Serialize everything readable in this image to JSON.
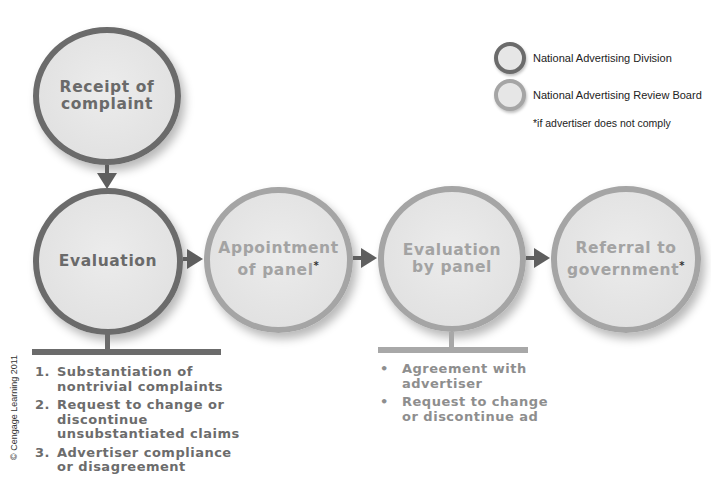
{
  "legend": {
    "items": [
      {
        "label": "National Advertising Division",
        "ring_color": "#6b6b6b"
      },
      {
        "label": "National Advertising Review Board",
        "ring_color": "#a5a5a5"
      }
    ],
    "note": "*if advertiser does not comply"
  },
  "nodes": {
    "receipt": {
      "line1": "Receipt of",
      "line2": "complaint",
      "owner": "National Advertising Division"
    },
    "evaluation": {
      "line1": "Evaluation",
      "owner": "National Advertising Division"
    },
    "appointment": {
      "line1": "Appointment",
      "line2": "of panel",
      "star": "*",
      "owner": "National Advertising Review Board"
    },
    "panel_evaluation": {
      "line1": "Evaluation",
      "line2": "by panel",
      "owner": "National Advertising Review Board"
    },
    "referral": {
      "line1": "Referral to",
      "line2": "government",
      "star": "*",
      "owner": "National Advertising Review Board"
    }
  },
  "evaluation_steps": [
    {
      "marker": "1.",
      "text": "Substantiation of nontrivial complaints"
    },
    {
      "marker": "2.",
      "text": "Request to change or discontinue unsubstantiated claims"
    },
    {
      "marker": "3.",
      "text": "Advertiser compliance or disagreement"
    }
  ],
  "panel_outcomes": [
    {
      "marker": "•",
      "text": "Agreement with advertiser"
    },
    {
      "marker": "•",
      "text": "Request to change or discontinue ad"
    }
  ],
  "copyright": "© Cengage Learning 2011",
  "colors": {
    "nad_ring": "#6b6b6b",
    "narb_ring": "#a5a5a5",
    "fill": "#e4e4e4",
    "arrow": "#5e5e5e"
  }
}
